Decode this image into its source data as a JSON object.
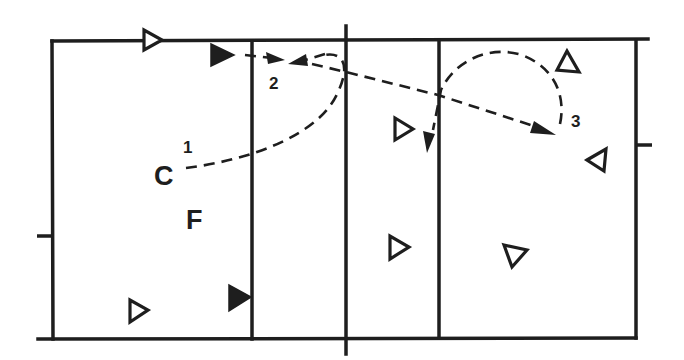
{
  "diagram": {
    "type": "volleyball-court-play",
    "colors": {
      "ink": "#1e1e1e",
      "background": "#ffffff"
    },
    "labels": {
      "C": "C",
      "F": "F",
      "step1": "1",
      "step2": "2",
      "step3": "3"
    },
    "players": [
      {
        "id": "p1",
        "style": "open",
        "direction": "right",
        "x": 150,
        "y": 40
      },
      {
        "id": "p2",
        "style": "filled",
        "direction": "right",
        "x": 220,
        "y": 55
      },
      {
        "id": "p3",
        "style": "filled",
        "direction": "right",
        "x": 238,
        "y": 297
      },
      {
        "id": "p4",
        "style": "open",
        "direction": "right",
        "x": 137,
        "y": 311
      },
      {
        "id": "p5",
        "style": "open",
        "direction": "right",
        "x": 403,
        "y": 128
      },
      {
        "id": "p6",
        "style": "open",
        "direction": "right",
        "x": 398,
        "y": 247
      },
      {
        "id": "p7",
        "style": "open",
        "direction": "up",
        "x": 568,
        "y": 62
      },
      {
        "id": "p8",
        "style": "open",
        "direction": "left",
        "x": 598,
        "y": 158
      },
      {
        "id": "p9",
        "style": "open",
        "direction": "down",
        "x": 513,
        "y": 253
      }
    ],
    "movements": [
      {
        "step": "1",
        "description": "Curved dashed path from C across to the net area"
      },
      {
        "step": "2",
        "description": "Dashed arrows converging at position 2 near left attack line"
      },
      {
        "step": "3",
        "description": "Long dashed arrow from 2 to position 3; loop around back to right attack line"
      }
    ]
  }
}
